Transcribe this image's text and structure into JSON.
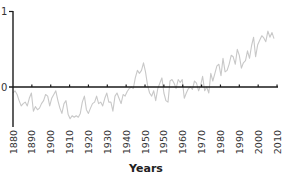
{
  "chart_data": {
    "type": "line",
    "title": "",
    "xlabel": "Years",
    "ylabel": "",
    "y_ticks": [
      "0",
      "1"
    ],
    "ylim": [
      -0.5,
      1.0
    ],
    "x_tick_labels": [
      "1880",
      "1890",
      "1900",
      "1910",
      "1920",
      "1930",
      "1940",
      "1950",
      "1950",
      "1960",
      "1970",
      "1980",
      "1990",
      "2000",
      "2010"
    ],
    "grid": false,
    "legend": null,
    "series": [
      {
        "name": "anomaly",
        "color": "#c8c8c8",
        "x": [
          1880,
          1881,
          1882,
          1883,
          1884,
          1885,
          1886,
          1887,
          1888,
          1889,
          1890,
          1891,
          1892,
          1893,
          1894,
          1895,
          1896,
          1897,
          1898,
          1899,
          1900,
          1901,
          1902,
          1903,
          1904,
          1905,
          1906,
          1907,
          1908,
          1909,
          1910,
          1911,
          1912,
          1913,
          1914,
          1915,
          1916,
          1917,
          1918,
          1919,
          1920,
          1921,
          1922,
          1923,
          1924,
          1925,
          1926,
          1927,
          1928,
          1929,
          1930,
          1931,
          1932,
          1933,
          1934,
          1935,
          1936,
          1937,
          1938,
          1939,
          1940,
          1941,
          1942,
          1943,
          1944,
          1945,
          1946,
          1947,
          1948,
          1949,
          1950,
          1951,
          1952,
          1953,
          1954,
          1955,
          1956,
          1957,
          1958,
          1959,
          1960,
          1961,
          1962,
          1963,
          1964,
          1965,
          1966,
          1967,
          1968,
          1969,
          1970,
          1971,
          1972,
          1973,
          1974,
          1975,
          1976,
          1977,
          1978,
          1979,
          1980,
          1981,
          1982,
          1983,
          1984,
          1985,
          1986,
          1987,
          1988,
          1989,
          1990,
          1991,
          1992,
          1993,
          1994,
          1995,
          1996,
          1997,
          1998,
          1999,
          2000,
          2001,
          2002,
          2003,
          2004,
          2005,
          2006,
          2007,
          2008
        ],
        "values": [
          -0.08,
          -0.05,
          -0.1,
          -0.18,
          -0.25,
          -0.22,
          -0.2,
          -0.25,
          -0.15,
          -0.08,
          -0.32,
          -0.26,
          -0.3,
          -0.28,
          -0.22,
          -0.18,
          -0.1,
          -0.12,
          -0.25,
          -0.15,
          -0.1,
          -0.05,
          -0.18,
          -0.28,
          -0.35,
          -0.22,
          -0.18,
          -0.36,
          -0.42,
          -0.38,
          -0.4,
          -0.38,
          -0.4,
          -0.35,
          -0.2,
          -0.12,
          -0.3,
          -0.35,
          -0.28,
          -0.22,
          -0.2,
          -0.12,
          -0.22,
          -0.2,
          -0.25,
          -0.15,
          -0.08,
          -0.2,
          -0.2,
          -0.32,
          -0.12,
          -0.08,
          -0.15,
          -0.22,
          -0.1,
          -0.12,
          -0.06,
          -0.02,
          0.0,
          -0.02,
          0.12,
          0.22,
          0.18,
          0.22,
          0.32,
          0.2,
          0.02,
          -0.08,
          -0.12,
          -0.05,
          -0.18,
          -0.02,
          0.05,
          0.12,
          -0.08,
          -0.18,
          -0.2,
          0.08,
          0.1,
          0.05,
          -0.02,
          0.1,
          0.06,
          0.1,
          -0.15,
          -0.08,
          -0.02,
          0.0,
          -0.03,
          0.08,
          0.05,
          -0.05,
          0.02,
          0.14,
          -0.05,
          0.0,
          -0.08,
          0.18,
          0.08,
          0.18,
          0.28,
          0.3,
          0.15,
          0.38,
          0.2,
          0.22,
          0.3,
          0.42,
          0.4,
          0.3,
          0.5,
          0.42,
          0.25,
          0.32,
          0.35,
          0.48,
          0.38,
          0.55,
          0.66,
          0.4,
          0.56,
          0.62,
          0.68,
          0.65,
          0.6,
          0.74,
          0.66,
          0.72,
          0.64
        ]
      }
    ],
    "axis_color": "#1a1a1a"
  }
}
